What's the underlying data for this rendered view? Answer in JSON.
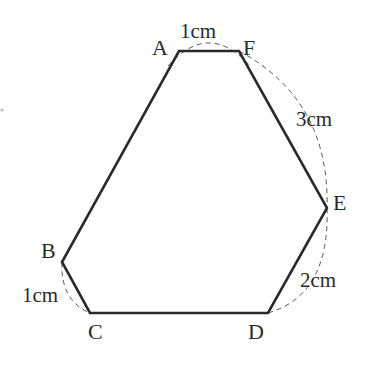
{
  "diagram": {
    "type": "hexagon",
    "vertices": [
      {
        "name": "A",
        "x": 179,
        "y": 51
      },
      {
        "name": "F",
        "x": 239,
        "y": 51
      },
      {
        "name": "E",
        "x": 327,
        "y": 208
      },
      {
        "name": "D",
        "x": 268,
        "y": 313
      },
      {
        "name": "C",
        "x": 90,
        "y": 313
      },
      {
        "name": "B",
        "x": 62,
        "y": 262
      }
    ],
    "labels": {
      "A": "A",
      "B": "B",
      "C": "C",
      "D": "D",
      "E": "E",
      "F": "F"
    },
    "lengths": {
      "AF": "1cm",
      "FE": "3cm",
      "ED": "2cm",
      "BC": "1cm"
    },
    "colors": {
      "edge": "#2a2a2a",
      "dashed_arc": "#555555",
      "background": "#ffffff"
    }
  }
}
